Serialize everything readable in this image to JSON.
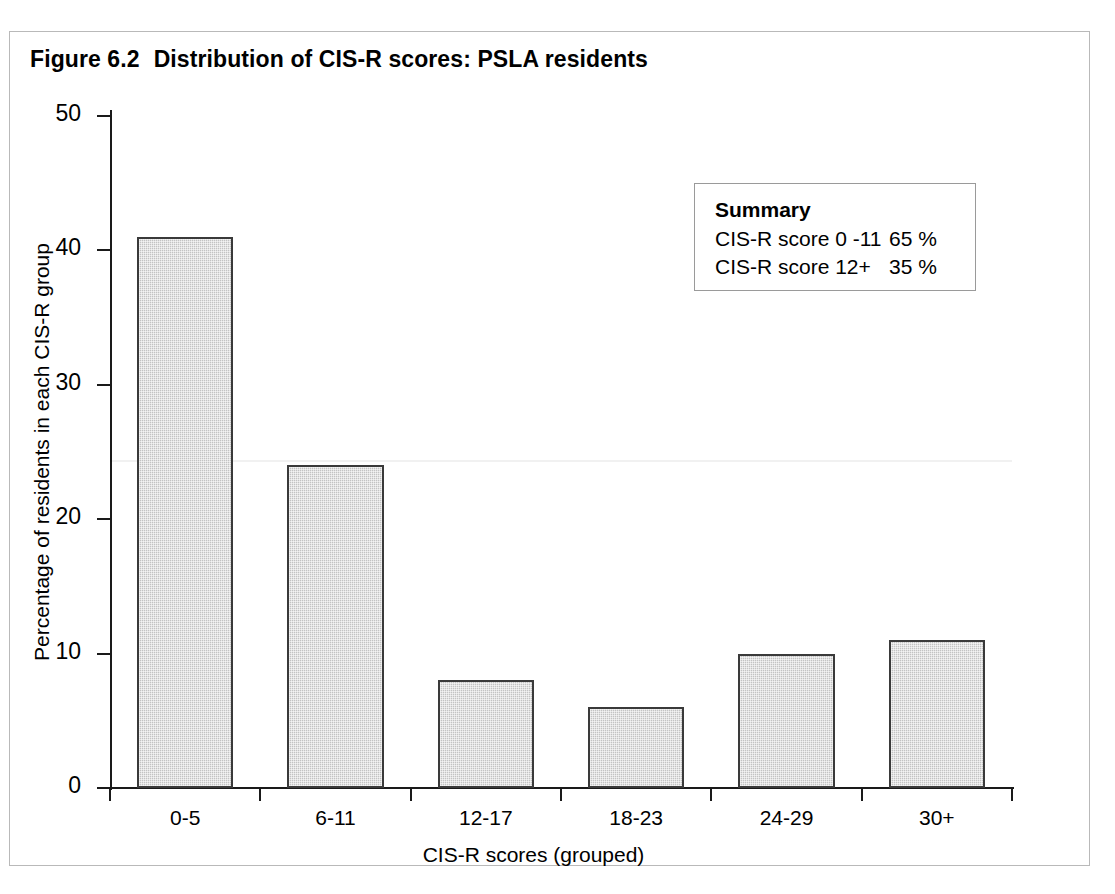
{
  "figure": {
    "number": "Figure 6.2",
    "title": "Distribution of CIS-R scores: PSLA residents"
  },
  "summary": {
    "heading": "Summary",
    "rows": [
      {
        "label": "CIS-R score 0 -11",
        "value": "65 %"
      },
      {
        "label": "CIS-R score 12+",
        "value": "35 %"
      }
    ]
  },
  "chart_data": {
    "type": "bar",
    "categories": [
      "0-5",
      "6-11",
      "12-17",
      "18-23",
      "24-29",
      "30+"
    ],
    "values": [
      41,
      24,
      8,
      6,
      10,
      11
    ],
    "xlabel": "CIS-R scores (grouped)",
    "ylabel": "Percentage of residents in each CIS-R group",
    "ylim": [
      0,
      50
    ],
    "yticks": [
      0,
      10,
      20,
      30,
      40,
      50
    ],
    "ytick_labels": [
      "0",
      "10",
      "20",
      "30",
      "40",
      "50"
    ],
    "grid": false,
    "legend": false,
    "bar_fill": "#c3c3c3",
    "bar_edge": "#3a3a3a",
    "series_name": "Percentage of residents"
  }
}
